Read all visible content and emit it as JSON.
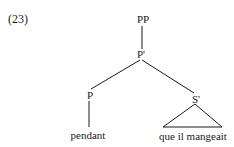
{
  "example": {
    "number": "(23)"
  },
  "tree": {
    "nodes": {
      "root": {
        "label": "PP"
      },
      "pbar": {
        "label": "P'"
      },
      "head": {
        "label": "P"
      },
      "sbar": {
        "label": "S'"
      },
      "head_word": {
        "label": "pendant"
      },
      "sbar_words": {
        "label": "que il mangeait"
      }
    },
    "edges": [
      [
        "PP",
        "P'"
      ],
      [
        "P'",
        "P"
      ],
      [
        "P'",
        "S'"
      ],
      [
        "P",
        "pendant"
      ],
      [
        "S'",
        "que il mangeait (triangle)"
      ]
    ]
  }
}
